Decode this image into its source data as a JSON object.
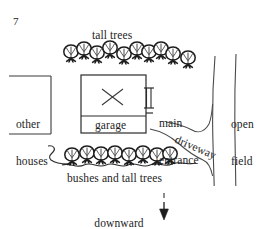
{
  "figure": {
    "page_number": "7",
    "kind": "hand-drawn site plan map",
    "ink_color": "#1d1d1d",
    "background_color": "#ffffff"
  },
  "labels": {
    "tall_trees": "tall trees",
    "other_houses_line1": "other",
    "other_houses_line2": "houses",
    "garage": "garage",
    "main_entrance_line1": "main",
    "main_entrance_line2": "entrance",
    "open_field_line1": "open",
    "open_field_line2": "field",
    "driveway": "driveway",
    "bushes_and_tall_trees": "bushes and tall trees",
    "downward_slope_line1": "downward",
    "downward_slope_line2": "slope"
  },
  "features": {
    "house_plot": {
      "name": "main house plot",
      "marker": "X",
      "garage_strip": "garage"
    },
    "other_houses_plot": {
      "name": "other houses plot",
      "open_side": "left"
    },
    "entrance_marker": {
      "name": "main entrance door symbol",
      "style": "double vertical bars with end caps"
    },
    "tree_row_top": {
      "name": "tall trees row",
      "count": 10
    },
    "tree_row_bottom": {
      "name": "bushes and tall trees row",
      "count": 8,
      "has_wavy_hedge_line": true
    },
    "road": {
      "name": "road",
      "lines": 2,
      "orientation": "vertical"
    },
    "driveway_path": {
      "name": "driveway curve",
      "connects": "house to road"
    },
    "slope_arrow": {
      "name": "downward slope arrow",
      "direction": "down",
      "style": "dashed shaft with solid head"
    }
  }
}
